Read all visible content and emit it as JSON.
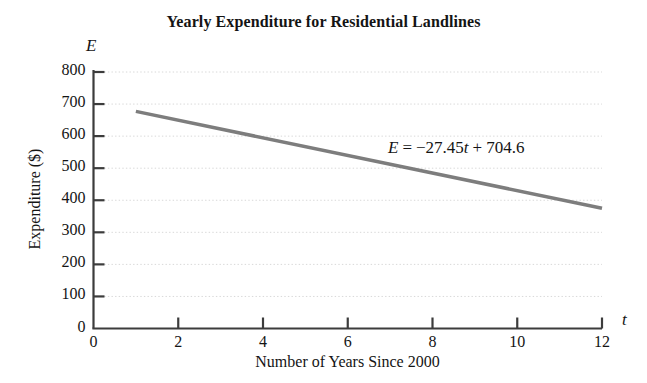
{
  "chart_data": {
    "type": "line",
    "title": "Yearly Expenditure for Residential Landlines",
    "xlabel": "Number of Years Since 2000",
    "ylabel": "Expenditure ($)",
    "x_var": "t",
    "y_var": "E",
    "xlim": [
      0,
      12
    ],
    "ylim": [
      0,
      800
    ],
    "xticks": [
      0,
      2,
      4,
      6,
      8,
      10,
      12
    ],
    "yticks": [
      0,
      100,
      200,
      300,
      400,
      500,
      600,
      700,
      800
    ],
    "xtick_labels": [
      "0",
      "2",
      "4",
      "6",
      "8",
      "10",
      "12"
    ],
    "ytick_labels": [
      "0",
      "100",
      "200",
      "300",
      "400",
      "500",
      "600",
      "700",
      "800"
    ],
    "grid": "horizontal-dotted",
    "legend": "none",
    "annotation": {
      "text": "E = -27.45t + 704.6",
      "lhs": "E",
      "equals": "=",
      "minus": "−",
      "slope": "27.45",
      "slope_var": "t",
      "plus": "+",
      "intercept": "704.6",
      "x": 7.0,
      "y": 512
    },
    "series": [
      {
        "name": "E = -27.45t + 704.6",
        "color": "#7d7d7d",
        "linewidth": 3.5,
        "x": [
          1,
          12
        ],
        "y": [
          677.15,
          375.2
        ],
        "equation": {
          "slope": -27.45,
          "intercept": 704.6
        }
      }
    ],
    "colors": {
      "line": "#7d7d7d",
      "axis": "#3c3c3c",
      "grid": "#d8d8d8",
      "text": "#141414",
      "background": "#ffffff"
    }
  }
}
